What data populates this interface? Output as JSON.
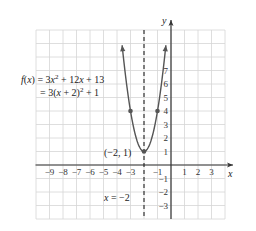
{
  "chart_data": {
    "type": "line",
    "title": "",
    "function": {
      "line1": "f(x) = 3x² + 12x + 13",
      "line1_parts": {
        "prefix": "f(x) = 3x",
        "sup": "2",
        "suffix": " + 12x + 13"
      },
      "line2": "= 3(x + 2)² + 1",
      "line2_parts": {
        "prefix": "= 3(x + 2)",
        "sup": "2",
        "suffix": " + 1"
      }
    },
    "xlabel": "x",
    "ylabel": "y",
    "xlim": [
      -10,
      4
    ],
    "ylim": [
      -4,
      10
    ],
    "grid": true,
    "x_tick_labels": [
      "-9",
      "-8",
      "-7",
      "-6",
      "-5",
      "-4",
      "-3",
      "-1",
      "1",
      "2",
      "3"
    ],
    "x_ticks": [
      -9,
      -8,
      -7,
      -6,
      -5,
      -4,
      -3,
      -1,
      1,
      2,
      3
    ],
    "y_tick_labels": [
      "7",
      "6",
      "5",
      "4",
      "3",
      "2",
      "1",
      "-1",
      "-2",
      "-3"
    ],
    "y_ticks": [
      7,
      6,
      5,
      4,
      3,
      2,
      1,
      -1,
      -2,
      -3
    ],
    "series": [
      {
        "name": "f(x) = 3(x + 2)^2 + 1",
        "x": [
          -3.6,
          -3.5,
          -3,
          -2.5,
          -2,
          -1.5,
          -1,
          -0.5,
          -0.4
        ],
        "values": [
          8.68,
          7.75,
          4,
          1.75,
          1,
          1.75,
          4,
          7.75,
          8.68
        ]
      }
    ],
    "points": [
      {
        "x": -3,
        "y": 4
      },
      {
        "x": -2,
        "y": 1,
        "label": "(−2, 1)"
      },
      {
        "x": -1,
        "y": 4
      }
    ],
    "vertex": {
      "x": -2,
      "y": 1,
      "label": "(−2, 1)"
    },
    "axis_of_symmetry": {
      "x": -2,
      "label": "x = −2",
      "style": "dashed"
    },
    "annotations": [
      "(−2, 1)",
      "x = −2"
    ]
  },
  "axis_labels": {
    "x": "x",
    "y": "y"
  },
  "vertex_label": "(−2, 1)",
  "symmetry_label": "x = −2",
  "colors": {
    "curve": "#555555",
    "grid": "#d6d6d6",
    "axis": "#333333",
    "point": "#555555"
  }
}
